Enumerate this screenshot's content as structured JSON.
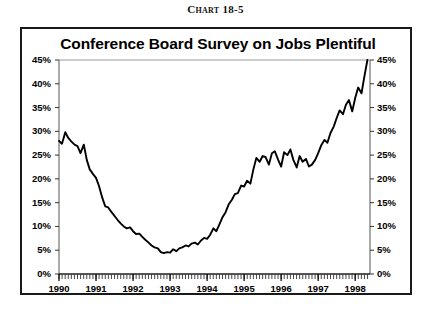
{
  "figure": {
    "chart_number": "Chart 18-5",
    "title": "Conference Board Survey on Jobs Plentiful"
  },
  "chart_data": {
    "type": "line",
    "title": "Conference Board Survey on Jobs Plentiful",
    "subtitle": "Chart 18-5",
    "xlabel": "",
    "ylabel": "",
    "xlim": [
      1990.0,
      1998.4
    ],
    "ylim": [
      0,
      45
    ],
    "ytick_labels": [
      "0%",
      "5%",
      "10%",
      "15%",
      "20%",
      "25%",
      "30%",
      "35%",
      "40%",
      "45%"
    ],
    "ytick_values": [
      0,
      5,
      10,
      15,
      20,
      25,
      30,
      35,
      40,
      45
    ],
    "ytick_labels_right": [
      "0%",
      "5%",
      "10%",
      "15%",
      "20%",
      "25%",
      "30%",
      "35%",
      "40%",
      "45%"
    ],
    "xtick_labels": [
      "1990",
      "1991",
      "1992",
      "1993",
      "1994",
      "1995",
      "1996",
      "1997",
      "1998"
    ],
    "xtick_values": [
      1990,
      1991,
      1992,
      1993,
      1994,
      1995,
      1996,
      1997,
      1998
    ],
    "minor_xticks_per_year": 12,
    "grid": false,
    "legend": false,
    "line_color": "#000000",
    "series": [
      {
        "name": "Jobs Plentiful",
        "units": "percent",
        "x": [
          1990.0,
          1990.08,
          1990.17,
          1990.25,
          1990.33,
          1990.42,
          1990.5,
          1990.58,
          1990.67,
          1990.75,
          1990.83,
          1990.92,
          1991.0,
          1991.08,
          1991.17,
          1991.25,
          1991.33,
          1991.42,
          1991.5,
          1991.58,
          1991.67,
          1991.75,
          1991.83,
          1991.92,
          1992.0,
          1992.08,
          1992.17,
          1992.25,
          1992.33,
          1992.42,
          1992.5,
          1992.58,
          1992.67,
          1992.75,
          1992.83,
          1992.92,
          1993.0,
          1993.08,
          1993.17,
          1993.25,
          1993.33,
          1993.42,
          1993.5,
          1993.58,
          1993.67,
          1993.75,
          1993.83,
          1993.92,
          1994.0,
          1994.08,
          1994.17,
          1994.25,
          1994.33,
          1994.42,
          1994.5,
          1994.58,
          1994.67,
          1994.75,
          1994.83,
          1994.92,
          1995.0,
          1995.08,
          1995.17,
          1995.25,
          1995.33,
          1995.42,
          1995.5,
          1995.58,
          1995.67,
          1995.75,
          1995.83,
          1995.92,
          1996.0,
          1996.08,
          1996.17,
          1996.25,
          1996.33,
          1996.42,
          1996.5,
          1996.58,
          1996.67,
          1996.75,
          1996.83,
          1996.92,
          1997.0,
          1997.08,
          1997.17,
          1997.25,
          1997.33,
          1997.42,
          1997.5,
          1997.58,
          1997.67,
          1997.75,
          1997.83,
          1997.92,
          1998.0,
          1998.08,
          1998.17,
          1998.25,
          1998.33
        ],
        "values": [
          28.0,
          27.4,
          29.8,
          28.6,
          27.9,
          27.2,
          26.9,
          25.4,
          27.2,
          24.0,
          22.0,
          21.0,
          20.2,
          18.5,
          16.0,
          14.2,
          14.0,
          13.0,
          12.2,
          11.4,
          10.6,
          10.0,
          9.6,
          9.8,
          9.0,
          8.4,
          8.5,
          7.8,
          7.2,
          6.6,
          6.0,
          5.6,
          5.4,
          4.6,
          4.4,
          4.6,
          4.5,
          5.2,
          4.8,
          5.4,
          5.6,
          6.0,
          5.8,
          6.4,
          6.6,
          6.2,
          7.0,
          7.6,
          7.4,
          8.2,
          9.6,
          9.0,
          10.4,
          12.0,
          13.0,
          14.6,
          15.6,
          16.8,
          17.0,
          18.6,
          18.4,
          19.6,
          19.0,
          22.0,
          24.4,
          23.6,
          24.8,
          24.6,
          23.0,
          25.4,
          25.8,
          24.0,
          22.6,
          25.6,
          25.0,
          26.2,
          24.0,
          22.4,
          24.8,
          23.6,
          24.2,
          22.6,
          23.0,
          24.0,
          25.4,
          27.0,
          28.2,
          27.6,
          29.6,
          31.0,
          32.8,
          34.4,
          33.6,
          35.6,
          36.6,
          34.2,
          37.0,
          39.2,
          38.0,
          41.6,
          45.0
        ]
      }
    ]
  }
}
